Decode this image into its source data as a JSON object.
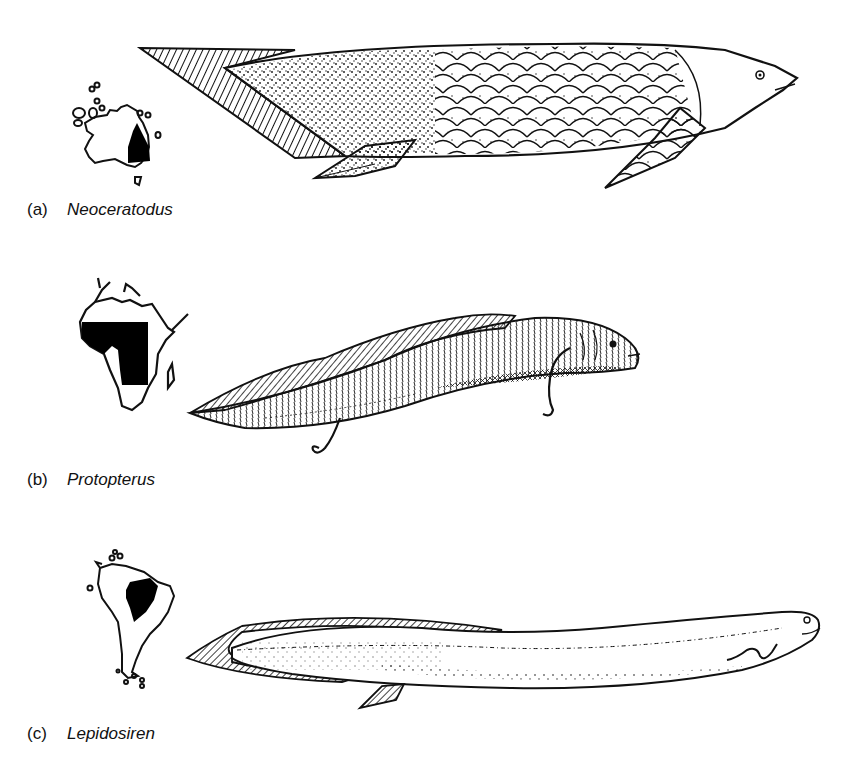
{
  "figure": {
    "panels": [
      {
        "letter": "(a)",
        "genus": "Neoceratodus",
        "map_region": "Australia",
        "map_icon": "australia-distribution-map",
        "illustration": "neoceratodus-lungfish"
      },
      {
        "letter": "(b)",
        "genus": "Protopterus",
        "map_region": "Africa",
        "map_icon": "africa-distribution-map",
        "illustration": "protopterus-lungfish"
      },
      {
        "letter": "(c)",
        "genus": "Lepidosiren",
        "map_region": "South America",
        "map_icon": "south-america-distribution-map",
        "illustration": "lepidosiren-lungfish"
      }
    ],
    "colors": {
      "ink": "#111111",
      "background": "#ffffff",
      "range_fill": "#000000"
    }
  }
}
